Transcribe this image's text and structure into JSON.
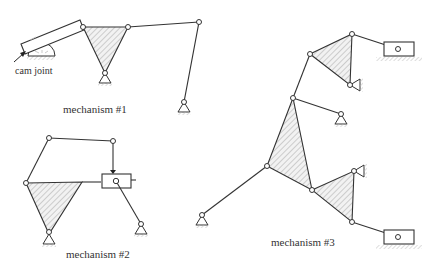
{
  "figure": {
    "width": 439,
    "height": 270,
    "colors": {
      "line": "#333333",
      "hatch": "#bbbbbb",
      "background": "#ffffff",
      "label": "#333333"
    }
  },
  "labels": {
    "cam_joint": "cam joint",
    "mechanism_1": "mechanism #1",
    "mechanism_2": "mechanism #2",
    "mechanism_3": "mechanism #3"
  },
  "mechanisms": [
    {
      "id": "mechanism_1",
      "label": "mechanism #1",
      "components": [
        "cam joint with slotted bar",
        "hatched ternary link (triangle) on ground pivot",
        "coupler link",
        "rocker on ground pivot"
      ]
    },
    {
      "id": "mechanism_2",
      "label": "mechanism #2",
      "components": [
        "hatched ternary link on ground pivot",
        "two binary links",
        "slider block with pin",
        "crank on ground pivot"
      ]
    },
    {
      "id": "mechanism_3",
      "label": "mechanism #3",
      "components": [
        "two hatched ternary links",
        "two sliders on ground",
        "three ground pivots",
        "multiple binary links"
      ]
    }
  ]
}
